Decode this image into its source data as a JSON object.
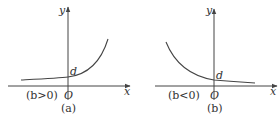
{
  "panels": [
    {
      "id": "a",
      "caption": "(a)",
      "condition": "(b>0)",
      "y_axis_label": "y",
      "x_axis_label": "x",
      "origin_label": "O",
      "intercept_label": "d",
      "curve_type": "increasing exponential"
    },
    {
      "id": "b",
      "caption": "(b)",
      "condition": "(b<0)",
      "y_axis_label": "y",
      "x_axis_label": "x",
      "origin_label": "O",
      "intercept_label": "d",
      "curve_type": "decreasing exponential"
    }
  ],
  "colors": {
    "line": "#444444",
    "text": "#333333",
    "background": "#ffffff"
  }
}
